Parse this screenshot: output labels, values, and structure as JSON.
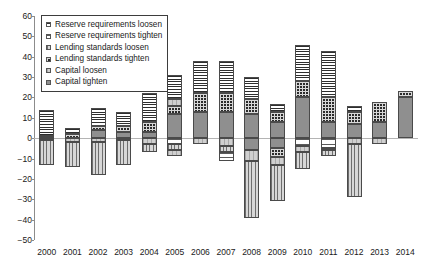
{
  "chart_data": {
    "type": "bar",
    "stacked": true,
    "title": "",
    "subtitle": "",
    "xlabel": "",
    "ylabel": "",
    "ylim": [
      -50,
      60
    ],
    "ytick_step": 10,
    "yticks": [
      60,
      50,
      40,
      30,
      20,
      10,
      0,
      -10,
      -20,
      -30,
      -40,
      -50
    ],
    "ytick_labels": [
      "60",
      "50",
      "40",
      "30",
      "20",
      "10",
      "0",
      "−10",
      "−20",
      "−30",
      "−40",
      "−50"
    ],
    "grid": false,
    "zero_line": true,
    "legend_position": "upper-left-inside",
    "categories": [
      "2000",
      "2001",
      "2002",
      "2003",
      "2004",
      "2005",
      "2006",
      "2007",
      "2008",
      "2009",
      "2010",
      "2011",
      "2012",
      "2013",
      "2014"
    ],
    "series": [
      {
        "name": "Reserve requirements loosen",
        "pattern": "p-rr-loosen",
        "sign": "positive",
        "values": [
          13,
          3,
          9,
          7,
          14,
          15,
          16,
          16,
          11,
          4,
          18,
          23,
          3,
          0,
          0
        ]
      },
      {
        "name": "Reserve requirements tighten",
        "pattern": "p-rr-tighten",
        "sign": "negative",
        "values": [
          0,
          0,
          0,
          0,
          0,
          -3,
          0,
          -4,
          0,
          0,
          -4,
          -5,
          0,
          0,
          0
        ]
      },
      {
        "name": "Lending standards loosen",
        "pattern": "p-ls-loosen",
        "sign": "negative",
        "values": [
          -12,
          -12,
          -16,
          -12,
          -4,
          -3,
          0,
          -3,
          -28,
          -18,
          -8,
          -3,
          -26,
          0,
          0
        ]
      },
      {
        "name": "Lending standards tighten",
        "pattern": "p-ls-tighten",
        "sign": "positive",
        "values": [
          0,
          2,
          2,
          3,
          5,
          4,
          6,
          6,
          6,
          5,
          8,
          12,
          6,
          10,
          3
        ]
      },
      {
        "name": "Capital loosen",
        "pattern": "p-cap-loosen",
        "sign": "negative",
        "values": [
          -1,
          -2,
          -2,
          -1,
          -3,
          -3,
          -3,
          -4,
          -11,
          -13,
          -3,
          -1,
          -3,
          -3,
          0
        ]
      },
      {
        "name": "Capital tighten",
        "pattern": "p-cap-tighten",
        "sign": "positive",
        "values": [
          1,
          0,
          4,
          3,
          3,
          12,
          16,
          16,
          13,
          8,
          20,
          8,
          7,
          8,
          20
        ]
      }
    ],
    "totals_positive": [
      14,
      5,
      15,
      13,
      22,
      31,
      38,
      38,
      30,
      17,
      46,
      43,
      16,
      18,
      23
    ],
    "totals_negative": [
      -13,
      -14,
      -18,
      -13,
      -7,
      -9,
      -3,
      -11,
      -39,
      -31,
      -15,
      -9,
      -29,
      -3,
      0
    ],
    "bars": [
      {
        "year": "2000",
        "positive": [
          {
            "series": "Capital tighten",
            "pattern": "p-cap-tighten",
            "from": 0,
            "to": 1
          },
          {
            "series": "Reserve requirements loosen",
            "pattern": "p-rr-loosen",
            "from": 1,
            "to": 14
          }
        ],
        "negative": [
          {
            "series": "Capital loosen",
            "pattern": "p-cap-loosen",
            "from": 0,
            "to": -1
          },
          {
            "series": "Lending standards loosen",
            "pattern": "p-ls-loosen",
            "from": -1,
            "to": -13
          }
        ]
      },
      {
        "year": "2001",
        "positive": [
          {
            "series": "Lending standards tighten",
            "pattern": "p-ls-tighten",
            "from": 0,
            "to": 2
          },
          {
            "series": "Reserve requirements loosen",
            "pattern": "p-rr-loosen",
            "from": 2,
            "to": 5
          }
        ],
        "negative": [
          {
            "series": "Capital loosen",
            "pattern": "p-cap-loosen",
            "from": 0,
            "to": -2
          },
          {
            "series": "Lending standards loosen",
            "pattern": "p-ls-loosen",
            "from": -2,
            "to": -14
          }
        ]
      },
      {
        "year": "2002",
        "positive": [
          {
            "series": "Capital tighten",
            "pattern": "p-cap-tighten",
            "from": 0,
            "to": 4
          },
          {
            "series": "Lending standards tighten",
            "pattern": "p-ls-tighten",
            "from": 4,
            "to": 6
          },
          {
            "series": "Reserve requirements loosen",
            "pattern": "p-rr-loosen",
            "from": 6,
            "to": 15
          }
        ],
        "negative": [
          {
            "series": "Capital loosen",
            "pattern": "p-cap-loosen",
            "from": 0,
            "to": -2
          },
          {
            "series": "Lending standards loosen",
            "pattern": "p-ls-loosen",
            "from": -2,
            "to": -18
          }
        ]
      },
      {
        "year": "2003",
        "positive": [
          {
            "series": "Capital tighten",
            "pattern": "p-cap-tighten",
            "from": 0,
            "to": 3
          },
          {
            "series": "Lending standards tighten",
            "pattern": "p-ls-tighten",
            "from": 3,
            "to": 6
          },
          {
            "series": "Reserve requirements loosen",
            "pattern": "p-rr-loosen",
            "from": 6,
            "to": 13
          }
        ],
        "negative": [
          {
            "series": "Capital loosen",
            "pattern": "p-cap-loosen",
            "from": 0,
            "to": -1
          },
          {
            "series": "Lending standards loosen",
            "pattern": "p-ls-loosen",
            "from": -1,
            "to": -13
          }
        ]
      },
      {
        "year": "2004",
        "positive": [
          {
            "series": "Capital tighten",
            "pattern": "p-cap-tighten",
            "from": 0,
            "to": 3
          },
          {
            "series": "Lending standards tighten",
            "pattern": "p-ls-tighten",
            "from": 3,
            "to": 8
          },
          {
            "series": "Reserve requirements loosen",
            "pattern": "p-rr-loosen",
            "from": 8,
            "to": 22
          }
        ],
        "negative": [
          {
            "series": "Capital loosen",
            "pattern": "p-cap-loosen",
            "from": 0,
            "to": -3
          },
          {
            "series": "Lending standards loosen",
            "pattern": "p-ls-loosen",
            "from": -3,
            "to": -7
          }
        ]
      },
      {
        "year": "2005",
        "positive": [
          {
            "series": "Capital tighten",
            "pattern": "p-cap-tighten",
            "from": 0,
            "to": 12
          },
          {
            "series": "Lending standards tighten",
            "pattern": "p-ls-tighten",
            "from": 12,
            "to": 16
          },
          {
            "series": "Capital loosen",
            "pattern": "p-cap-loosen",
            "from": 16,
            "to": 19
          },
          {
            "series": "Reserve requirements loosen",
            "pattern": "p-rr-loosen",
            "from": 19,
            "to": 31
          }
        ],
        "negative": [
          {
            "series": "Reserve requirements tighten",
            "pattern": "p-rr-tighten",
            "from": 0,
            "to": -3
          },
          {
            "series": "Lending standards loosen",
            "pattern": "p-ls-loosen",
            "from": -3,
            "to": -6
          },
          {
            "series": "Capital loosen",
            "pattern": "p-cap-loosen",
            "from": -6,
            "to": -9
          }
        ]
      },
      {
        "year": "2006",
        "positive": [
          {
            "series": "Capital tighten",
            "pattern": "p-cap-tighten",
            "from": 0,
            "to": 13
          },
          {
            "series": "Lending standards tighten",
            "pattern": "p-ls-tighten",
            "from": 13,
            "to": 22
          },
          {
            "series": "Reserve requirements loosen",
            "pattern": "p-rr-loosen",
            "from": 22,
            "to": 38
          }
        ],
        "negative": [
          {
            "series": "Capital loosen",
            "pattern": "p-cap-loosen",
            "from": 0,
            "to": -3
          }
        ]
      },
      {
        "year": "2007",
        "positive": [
          {
            "series": "Capital tighten",
            "pattern": "p-cap-tighten",
            "from": 0,
            "to": 13
          },
          {
            "series": "Lending standards tighten",
            "pattern": "p-ls-tighten",
            "from": 13,
            "to": 22
          },
          {
            "series": "Reserve requirements loosen",
            "pattern": "p-rr-loosen",
            "from": 22,
            "to": 38
          }
        ],
        "negative": [
          {
            "series": "Capital loosen",
            "pattern": "p-cap-loosen",
            "from": 0,
            "to": -4
          },
          {
            "series": "Lending standards loosen",
            "pattern": "p-ls-loosen",
            "from": -4,
            "to": -7
          },
          {
            "series": "Reserve requirements tighten",
            "pattern": "p-rr-tighten",
            "from": -7,
            "to": -11
          }
        ]
      },
      {
        "year": "2008",
        "positive": [
          {
            "series": "Capital tighten",
            "pattern": "p-cap-tighten",
            "from": 0,
            "to": 12
          },
          {
            "series": "Lending standards tighten",
            "pattern": "p-ls-tighten",
            "from": 12,
            "to": 19
          },
          {
            "series": "Reserve requirements loosen",
            "pattern": "p-rr-loosen",
            "from": 19,
            "to": 30
          }
        ],
        "negative": [
          {
            "series": "Capital tighten",
            "pattern": "p-cap-tighten",
            "from": 0,
            "to": -6
          },
          {
            "series": "Capital loosen",
            "pattern": "p-cap-loosen",
            "from": -6,
            "to": -11
          },
          {
            "series": "Lending standards loosen",
            "pattern": "p-ls-loosen",
            "from": -11,
            "to": -39
          }
        ]
      },
      {
        "year": "2009",
        "positive": [
          {
            "series": "Capital tighten",
            "pattern": "p-cap-tighten",
            "from": 0,
            "to": 8
          },
          {
            "series": "Lending standards tighten",
            "pattern": "p-ls-tighten",
            "from": 8,
            "to": 13
          },
          {
            "series": "Reserve requirements loosen",
            "pattern": "p-rr-loosen",
            "from": 13,
            "to": 17
          }
        ],
        "negative": [
          {
            "series": "Capital tighten",
            "pattern": "p-cap-tighten",
            "from": 0,
            "to": -5
          },
          {
            "series": "Lending standards tighten",
            "pattern": "p-ls-tighten",
            "from": -5,
            "to": -9
          },
          {
            "series": "Capital loosen",
            "pattern": "p-cap-loosen",
            "from": -9,
            "to": -13
          },
          {
            "series": "Lending standards loosen",
            "pattern": "p-ls-loosen",
            "from": -13,
            "to": -31
          }
        ]
      },
      {
        "year": "2010",
        "positive": [
          {
            "series": "Capital tighten",
            "pattern": "p-cap-tighten",
            "from": 0,
            "to": 20
          },
          {
            "series": "Lending standards tighten",
            "pattern": "p-ls-tighten",
            "from": 20,
            "to": 28
          },
          {
            "series": "Reserve requirements loosen",
            "pattern": "p-rr-loosen",
            "from": 28,
            "to": 46
          }
        ],
        "negative": [
          {
            "series": "Reserve requirements tighten",
            "pattern": "p-rr-tighten",
            "from": 0,
            "to": -4
          },
          {
            "series": "Capital loosen",
            "pattern": "p-cap-loosen",
            "from": -4,
            "to": -7
          },
          {
            "series": "Lending standards loosen",
            "pattern": "p-ls-loosen",
            "from": -7,
            "to": -15
          }
        ]
      },
      {
        "year": "2011",
        "positive": [
          {
            "series": "Capital tighten",
            "pattern": "p-cap-tighten",
            "from": 0,
            "to": 8
          },
          {
            "series": "Lending standards tighten",
            "pattern": "p-ls-tighten",
            "from": 8,
            "to": 20
          },
          {
            "series": "Reserve requirements loosen",
            "pattern": "p-rr-loosen",
            "from": 20,
            "to": 43
          }
        ],
        "negative": [
          {
            "series": "Reserve requirements tighten",
            "pattern": "p-rr-tighten",
            "from": 0,
            "to": -5
          },
          {
            "series": "Capital loosen",
            "pattern": "p-cap-loosen",
            "from": -5,
            "to": -6
          },
          {
            "series": "Lending standards loosen",
            "pattern": "p-ls-loosen",
            "from": -6,
            "to": -9
          }
        ]
      },
      {
        "year": "2012",
        "positive": [
          {
            "series": "Capital tighten",
            "pattern": "p-cap-tighten",
            "from": 0,
            "to": 7
          },
          {
            "series": "Lending standards tighten",
            "pattern": "p-ls-tighten",
            "from": 7,
            "to": 13
          },
          {
            "series": "Reserve requirements loosen",
            "pattern": "p-rr-loosen",
            "from": 13,
            "to": 16
          }
        ],
        "negative": [
          {
            "series": "Capital loosen",
            "pattern": "p-cap-loosen",
            "from": 0,
            "to": -3
          },
          {
            "series": "Lending standards loosen",
            "pattern": "p-ls-loosen",
            "from": -3,
            "to": -29
          }
        ]
      },
      {
        "year": "2013",
        "positive": [
          {
            "series": "Capital tighten",
            "pattern": "p-cap-tighten",
            "from": 0,
            "to": 8
          },
          {
            "series": "Lending standards tighten",
            "pattern": "p-ls-tighten",
            "from": 8,
            "to": 18
          }
        ],
        "negative": [
          {
            "series": "Capital loosen",
            "pattern": "p-cap-loosen",
            "from": 0,
            "to": -3
          }
        ]
      },
      {
        "year": "2014",
        "positive": [
          {
            "series": "Capital tighten",
            "pattern": "p-cap-tighten",
            "from": 0,
            "to": 20
          },
          {
            "series": "Lending standards tighten",
            "pattern": "p-ls-tighten",
            "from": 20,
            "to": 23
          }
        ],
        "negative": []
      }
    ]
  },
  "legend": {
    "items": [
      {
        "label": "Reserve requirements loosen",
        "pattern": "p-rr-loosen"
      },
      {
        "label": "Reserve requirements tighten",
        "pattern": "p-rr-tighten"
      },
      {
        "label": "Lending standards loosen",
        "pattern": "p-ls-loosen"
      },
      {
        "label": "Lending standards tighten",
        "pattern": "p-ls-tighten"
      },
      {
        "label": "Capital loosen",
        "pattern": "p-cap-loosen"
      },
      {
        "label": "Capital tighten",
        "pattern": "p-cap-tighten"
      }
    ]
  },
  "colors": {
    "axis": "#8c8c8c",
    "zero_line": "#b4b4b4",
    "text": "#1a1a1a",
    "segment_border": "#4a4a4a",
    "background": "#ffffff",
    "capital_tighten_fill": "#8f8f8f",
    "lending_tighten_fill": "#2b2b2b",
    "capital_loosen_fill": "#cfcfcf",
    "lending_loosen_fill": "#d7d7d7"
  }
}
